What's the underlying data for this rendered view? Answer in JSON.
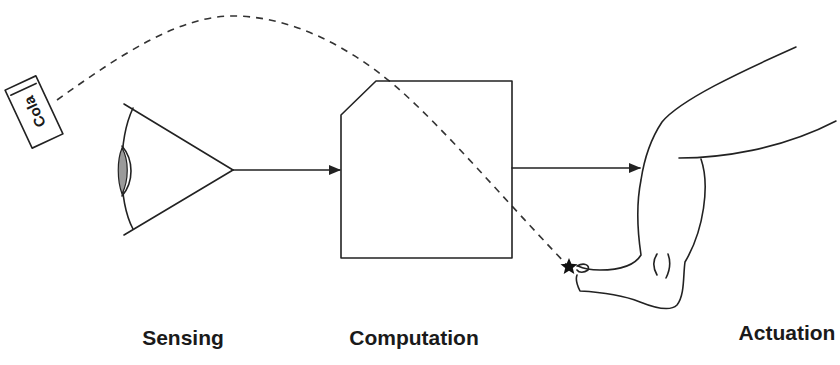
{
  "diagram": {
    "stages": [
      {
        "id": "sensing",
        "label": "Sensing",
        "icon": "eye-icon"
      },
      {
        "id": "computation",
        "label": "Computation",
        "icon": "processor-box-icon"
      },
      {
        "id": "actuation",
        "label": "Actuation",
        "icon": "leg-foot-icon"
      }
    ],
    "object": {
      "label": "Cola",
      "icon": "cola-can-icon"
    },
    "trajectory": {
      "style": "dashed",
      "from": "cola",
      "to": "foot",
      "target_marker": "star-icon"
    },
    "arrows": [
      {
        "from": "sensing",
        "to": "computation"
      },
      {
        "from": "computation",
        "to": "actuation"
      }
    ],
    "colors": {
      "line": "#222222",
      "background": "#ffffff",
      "lens_fill": "#9a9a9a"
    }
  }
}
